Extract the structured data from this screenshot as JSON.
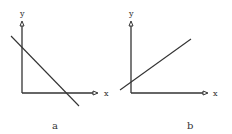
{
  "panels": [
    {
      "caption": "a",
      "x_axis_label": "x",
      "y_axis_label": "y",
      "line_description": "negative slope, positive y-intercept, positive x-intercept"
    },
    {
      "caption": "b",
      "x_axis_label": "x",
      "y_axis_label": "y",
      "line_description": "positive slope, positive y-intercept"
    }
  ],
  "colors": {
    "stroke": "#333333",
    "background": "#ffffff"
  }
}
